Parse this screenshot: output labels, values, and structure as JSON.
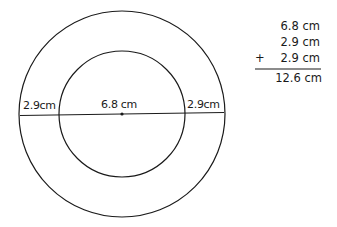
{
  "diagram": {
    "type": "concentric-circles",
    "labels": {
      "left_ring_width": "2.9cm",
      "inner_diameter": "6.8 cm",
      "right_ring_width": "2.9cm"
    },
    "sum": {
      "line1": "6.8 cm",
      "line2": "2.9 cm",
      "line3_operator": "+",
      "line3": "2.9 cm",
      "result": "12.6 cm"
    }
  }
}
